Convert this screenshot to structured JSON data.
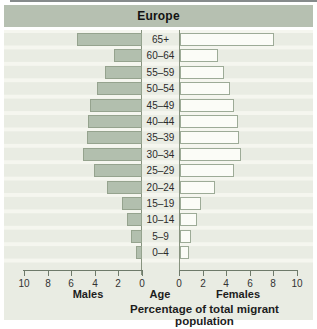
{
  "title": "Europe",
  "labels": {
    "males": "Males",
    "age": "Age",
    "females": "Females",
    "caption": "Percentage of total migrant population"
  },
  "axis": {
    "left_ticks": [
      10,
      8,
      6,
      4,
      2,
      0
    ],
    "right_ticks": [
      0,
      2,
      4,
      6,
      8,
      10
    ],
    "xlim": [
      0,
      10
    ]
  },
  "chart_data": {
    "type": "bar",
    "subtype": "population-pyramid",
    "title": "Europe",
    "orientation": "horizontal",
    "categories_top_to_bottom": [
      "65+",
      "60–64",
      "55–59",
      "50–54",
      "45–49",
      "40–44",
      "35–39",
      "30–34",
      "25–29",
      "20–24",
      "15–19",
      "10–14",
      "5–9",
      "0–4"
    ],
    "series": [
      {
        "name": "Males",
        "side": "left",
        "values": [
          5.5,
          2.4,
          3.1,
          3.8,
          4.4,
          4.6,
          4.7,
          5.0,
          4.1,
          3.0,
          1.7,
          1.3,
          0.9,
          0.55
        ]
      },
      {
        "name": "Females",
        "side": "right",
        "values": [
          8.0,
          3.2,
          3.7,
          4.2,
          4.6,
          4.9,
          5.0,
          5.15,
          4.6,
          3.0,
          1.8,
          1.4,
          0.95,
          0.75
        ]
      }
    ],
    "xlabel": "Percentage of total migrant population",
    "xlim": [
      0,
      10
    ],
    "tick_step": 2,
    "grid": "horizontal-stripes",
    "legend": "none"
  },
  "colors": {
    "header_bg": "#b6c0b1",
    "plot_bg": "#e9ece3",
    "stripe": "#f5f6ef",
    "male_bar_fill": "#b2bfae",
    "male_bar_border": "#95a38e",
    "female_bar_fill": "#fbfcf7",
    "female_bar_border": "#9dab97",
    "axis_line": "#6e7a6a",
    "zero_line": "#87937f",
    "text": "#1d1d1d"
  }
}
